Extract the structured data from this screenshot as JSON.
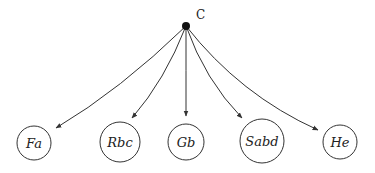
{
  "diagram": {
    "type": "tree",
    "root": {
      "label": "C",
      "x": 186,
      "y": 26,
      "r": 4,
      "label_x": 196,
      "label_y": 19
    },
    "nodes": [
      {
        "id": "fa",
        "label": "Fa",
        "cx": 34,
        "cy": 143,
        "r": 17,
        "arrow_end": [
          56,
          128
        ],
        "ctrl": [
          120,
          90
        ]
      },
      {
        "id": "rbc",
        "label": "Rbc",
        "cx": 120,
        "cy": 142,
        "r": 20,
        "arrow_end": [
          132,
          118
        ],
        "ctrl": [
          165,
          80
        ]
      },
      {
        "id": "gb",
        "label": "Gb",
        "cx": 186,
        "cy": 142,
        "r": 18,
        "arrow_end": [
          186,
          116
        ],
        "ctrl": [
          186,
          70
        ]
      },
      {
        "id": "sabd",
        "label": "Sabd",
        "cx": 262,
        "cy": 141,
        "r": 22,
        "arrow_end": [
          242,
          118
        ],
        "ctrl": [
          205,
          80
        ]
      },
      {
        "id": "he",
        "label": "He",
        "cx": 340,
        "cy": 142,
        "r": 17,
        "arrow_end": [
          318,
          130
        ],
        "ctrl": [
          240,
          95
        ]
      }
    ],
    "colors": {
      "stroke": "#333333",
      "root_fill": "#111111",
      "text": "#222222",
      "background": "#ffffff"
    }
  }
}
